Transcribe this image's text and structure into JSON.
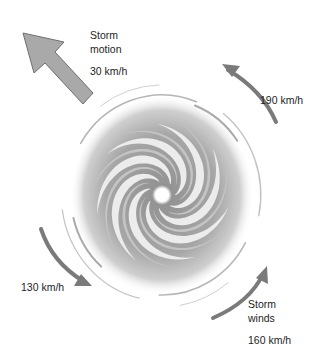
{
  "diagram": {
    "colors": {
      "arrow_fill": "#a9a9a9",
      "arrow_stroke": "#6f6f6f",
      "wind_arrow": "#7a7a7a",
      "spiral_dark": "#9d9d9d",
      "spiral_light": "#d6d6d6",
      "eye": "#ffffff",
      "text": "#1e1e1e"
    },
    "storm_motion": {
      "label_line1": "Storm",
      "label_line2": "motion",
      "speed": "30 km/h",
      "direction": "north-west"
    },
    "wind_labels": {
      "top_right": "190 km/h",
      "bottom_left": "130 km/h",
      "bottom_right_line1": "Storm",
      "bottom_right_line2": "winds",
      "bottom_right_speed": "160 km/h"
    },
    "rotation": "counter-clockwise",
    "spiral_arms": 7
  }
}
